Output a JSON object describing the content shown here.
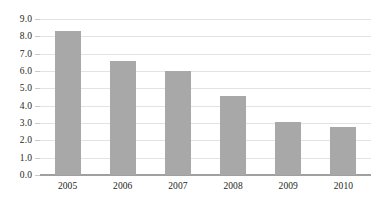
{
  "chart_data": {
    "type": "bar",
    "title": "",
    "subtitle": "",
    "xlabel": "",
    "ylabel": "",
    "categories": [
      "2005",
      "2006",
      "2007",
      "2008",
      "2009",
      "2010"
    ],
    "values": [
      8.3,
      6.55,
      6.0,
      4.55,
      3.05,
      2.75
    ],
    "series": [
      {
        "name": "",
        "values": [
          8.3,
          6.55,
          6.0,
          4.55,
          3.05,
          2.75
        ]
      }
    ],
    "ylim": [
      0.0,
      9.0
    ],
    "ytick_step": 1.0,
    "ytick_labels": [
      "0.0",
      "1.0",
      "2.0",
      "3.0",
      "4.0",
      "5.0",
      "6.0",
      "7.0",
      "8.0",
      "9.0"
    ],
    "ytick_values": [
      0.0,
      1.0,
      2.0,
      3.0,
      4.0,
      5.0,
      6.0,
      7.0,
      8.0,
      9.0
    ],
    "xtick_labels": [
      "2005",
      "2006",
      "2007",
      "2008",
      "2009",
      "2010"
    ],
    "grid": true,
    "grid_axis": "y",
    "legend": false,
    "legend_position": "none",
    "annotations": [],
    "colors": {
      "bar_fill": "#a8a8a8",
      "gridline": "#e3e3e3",
      "axis_line": "#a0a0a0",
      "tick_mark": "#c8c8c8",
      "text": "#231f20",
      "background": "#ffffff"
    }
  }
}
